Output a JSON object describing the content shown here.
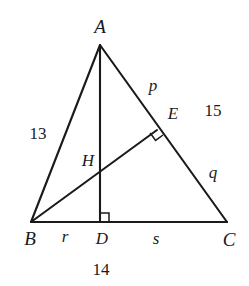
{
  "figure": {
    "kind": "triangle-geometry-diagram",
    "background_color": "#ffffff",
    "stroke_color": "#1a1a1a",
    "vertices": {
      "A": {
        "label": "A",
        "x": 100,
        "y": 45
      },
      "B": {
        "label": "B",
        "x": 31,
        "y": 222
      },
      "C": {
        "label": "C",
        "x": 227,
        "y": 222
      },
      "D": {
        "label": "D",
        "x": 100,
        "y": 222
      },
      "E": {
        "label": "E",
        "x": 157,
        "y": 130
      },
      "H": {
        "label": "H",
        "x": 100,
        "y": 168
      }
    },
    "vertex_labels": [
      {
        "name": "A",
        "text": "A",
        "x": 100,
        "y": 26
      },
      {
        "name": "B",
        "text": "B",
        "x": 30,
        "y": 238
      },
      {
        "name": "C",
        "text": "C",
        "x": 229,
        "y": 239
      },
      {
        "name": "D",
        "text": "D",
        "x": 102,
        "y": 238
      },
      {
        "name": "E",
        "text": "E",
        "x": 173,
        "y": 113
      },
      {
        "name": "H",
        "text": "H",
        "x": 88,
        "y": 160
      }
    ],
    "segment_labels": [
      {
        "name": "side-ab-length",
        "text": "13",
        "x": 38,
        "y": 133,
        "numeric": true
      },
      {
        "name": "side-ac-length",
        "text": "15",
        "x": 213,
        "y": 110,
        "numeric": true
      },
      {
        "name": "side-bc-length",
        "text": "14",
        "x": 101,
        "y": 269,
        "numeric": true
      },
      {
        "name": "segment-ae",
        "text": "p",
        "x": 153,
        "y": 85,
        "numeric": false
      },
      {
        "name": "segment-ec",
        "text": "q",
        "x": 213,
        "y": 172,
        "numeric": false
      },
      {
        "name": "segment-bd",
        "text": "r",
        "x": 65,
        "y": 236,
        "numeric": false
      },
      {
        "name": "segment-dc",
        "text": "s",
        "x": 156,
        "y": 238,
        "numeric": false
      }
    ],
    "right_angles": [
      {
        "name": "right-angle-at-d",
        "at": "D"
      },
      {
        "name": "right-angle-at-e",
        "at": "E"
      }
    ]
  }
}
